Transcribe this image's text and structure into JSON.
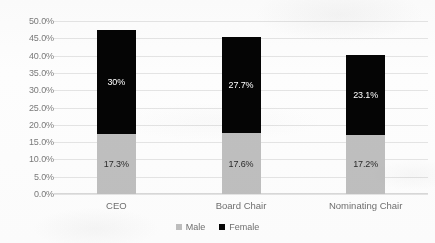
{
  "chart_data": {
    "type": "bar",
    "subtype": "stacked-bar",
    "title": "",
    "subtitle": "",
    "xlabel": "",
    "ylabel": "",
    "categories": [
      "CEO",
      "Board Chair",
      "Nominating Chair"
    ],
    "series": [
      {
        "name": "Male",
        "color": "#BFBFBF",
        "values": [
          17.3,
          17.6,
          17.2
        ],
        "labels": [
          "17.3%",
          "17.6%",
          "17.2%"
        ]
      },
      {
        "name": "Female",
        "color": "#000000",
        "values": [
          30.0,
          27.7,
          23.1
        ],
        "labels": [
          "30%",
          "27.7%",
          "23.1%"
        ]
      }
    ],
    "totals": [
      47.3,
      45.3,
      40.3
    ],
    "ylim": [
      0,
      50
    ],
    "ytick_step": 5,
    "ytick_labels": [
      "0.0%",
      "5.0%",
      "10.0%",
      "15.0%",
      "20.0%",
      "25.0%",
      "30.0%",
      "35.0%",
      "40.0%",
      "45.0%",
      "50.0%"
    ],
    "ytick_values": [
      0,
      5,
      10,
      15,
      20,
      25,
      30,
      35,
      40,
      45,
      50
    ],
    "grid": true,
    "grid_axis": "y",
    "legend_position": "bottom",
    "legend_entries": [
      "Male",
      "Female"
    ],
    "value_unit": "percent"
  },
  "colors": {
    "male": "#BFBFBF",
    "female": "#000000",
    "gridline": "#E4E4E4",
    "tick_text": "#7A7A7A",
    "category_text": "#6F6F6F",
    "background": "#FDFDFD"
  }
}
